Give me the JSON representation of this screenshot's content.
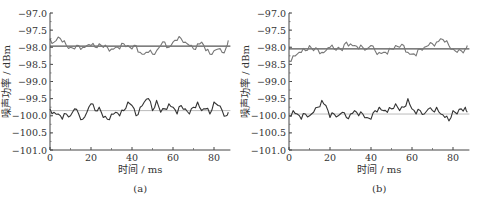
{
  "chart_data": [
    {
      "panel": "a",
      "type": "line",
      "caption": "(a)",
      "xlabel": "时间 / ms",
      "ylabel": "噪声功率 / dBm",
      "xlim": [
        0,
        88
      ],
      "ylim": [
        -101.0,
        -97.0
      ],
      "xticks": [
        0,
        20,
        40,
        60,
        80
      ],
      "xtick_labels": [
        "0",
        "20",
        "40",
        "60",
        "80"
      ],
      "yticks": [
        -97.0,
        -97.5,
        -98.0,
        -98.5,
        -99.0,
        -99.5,
        -100.0,
        -100.5,
        -101.0
      ],
      "ytick_labels": [
        "-97.0",
        "-97.5",
        "-98.0",
        "-98.5",
        "-99.0",
        "-99.5",
        "-100.0",
        "-100.5",
        "-101.0"
      ],
      "grid": false,
      "legend": null,
      "reference_lines": [
        {
          "name": "upper mean",
          "y": -97.97,
          "color": "#555555"
        },
        {
          "name": "lower mean",
          "y": -99.85,
          "color": "#bbbbbb"
        }
      ],
      "series": [
        {
          "name": "upper trace",
          "color": "#777777",
          "x": [
            0,
            2,
            4,
            6,
            8,
            10,
            12,
            14,
            16,
            18,
            20,
            22,
            24,
            26,
            28,
            30,
            32,
            34,
            36,
            38,
            40,
            42,
            44,
            46,
            48,
            50,
            52,
            54,
            56,
            58,
            60,
            62,
            64,
            66,
            68,
            70,
            72,
            74,
            76,
            78,
            80,
            82,
            84,
            86,
            87
          ],
          "values": [
            -97.75,
            -97.85,
            -97.7,
            -97.85,
            -97.95,
            -98.0,
            -98.05,
            -97.95,
            -98.0,
            -97.95,
            -97.95,
            -98.0,
            -97.9,
            -98.0,
            -98.0,
            -98.05,
            -98.0,
            -98.05,
            -97.9,
            -97.95,
            -98.05,
            -97.95,
            -98.15,
            -98.2,
            -98.15,
            -98.2,
            -98.1,
            -97.95,
            -97.85,
            -98.0,
            -97.85,
            -97.8,
            -97.75,
            -97.85,
            -97.95,
            -98.05,
            -97.9,
            -97.85,
            -98.1,
            -98.2,
            -98.1,
            -98.05,
            -98.15,
            -98.0,
            -97.8
          ]
        },
        {
          "name": "lower trace",
          "color": "#333333",
          "x": [
            0,
            2,
            4,
            6,
            8,
            10,
            12,
            14,
            16,
            18,
            20,
            22,
            24,
            26,
            28,
            30,
            32,
            34,
            36,
            38,
            40,
            42,
            44,
            46,
            48,
            50,
            52,
            54,
            56,
            58,
            60,
            62,
            64,
            66,
            68,
            70,
            72,
            74,
            76,
            78,
            80,
            82,
            84,
            86,
            87
          ],
          "values": [
            -99.8,
            -99.9,
            -99.95,
            -100.1,
            -99.95,
            -100.0,
            -99.8,
            -99.95,
            -100.1,
            -99.9,
            -99.65,
            -99.85,
            -99.75,
            -100.05,
            -100.1,
            -99.95,
            -99.9,
            -100.0,
            -99.85,
            -99.6,
            -99.7,
            -100.0,
            -99.75,
            -99.6,
            -99.5,
            -99.85,
            -99.55,
            -99.9,
            -99.8,
            -99.65,
            -99.75,
            -99.95,
            -99.7,
            -99.8,
            -99.95,
            -99.75,
            -99.6,
            -99.85,
            -99.8,
            -99.95,
            -99.6,
            -99.7,
            -99.85,
            -100.0,
            -99.9
          ]
        }
      ]
    },
    {
      "panel": "b",
      "type": "line",
      "caption": "(b)",
      "xlabel": "时间 / ms",
      "ylabel": "噪声功率 / dBm",
      "xlim": [
        0,
        88
      ],
      "ylim": [
        -101.0,
        -97.0
      ],
      "xticks": [
        0,
        20,
        40,
        60,
        80
      ],
      "xtick_labels": [
        "0",
        "20",
        "40",
        "60",
        "80"
      ],
      "yticks": [
        -97.0,
        -97.5,
        -98.0,
        -98.5,
        -99.0,
        -99.5,
        -100.0,
        -100.5,
        -101.0
      ],
      "ytick_labels": [
        "-97.0",
        "-97.5",
        "-98.0",
        "-98.5",
        "-99.0",
        "-99.5",
        "-100.0",
        "-100.5",
        "-101.0"
      ],
      "grid": false,
      "legend": null,
      "reference_lines": [
        {
          "name": "upper mean",
          "y": -98.05,
          "color": "#555555"
        },
        {
          "name": "lower mean",
          "y": -99.95,
          "color": "#bbbbbb"
        }
      ],
      "series": [
        {
          "name": "upper trace",
          "color": "#777777",
          "x": [
            0,
            2,
            4,
            6,
            8,
            10,
            12,
            14,
            16,
            18,
            20,
            22,
            24,
            26,
            28,
            30,
            32,
            34,
            36,
            38,
            40,
            42,
            44,
            46,
            48,
            50,
            52,
            54,
            56,
            58,
            60,
            62,
            64,
            66,
            68,
            70,
            72,
            74,
            76,
            78,
            80,
            82,
            84,
            86,
            87
          ],
          "values": [
            -98.4,
            -98.25,
            -98.2,
            -98.15,
            -98.1,
            -97.95,
            -98.1,
            -98.05,
            -98.15,
            -98.1,
            -98.0,
            -98.05,
            -98.0,
            -98.1,
            -97.85,
            -97.9,
            -97.95,
            -98.05,
            -98.0,
            -98.05,
            -97.95,
            -98.1,
            -98.15,
            -98.15,
            -98.2,
            -98.05,
            -97.95,
            -98.0,
            -97.95,
            -98.15,
            -98.2,
            -98.25,
            -98.05,
            -98.0,
            -97.95,
            -97.9,
            -97.85,
            -97.75,
            -97.85,
            -97.95,
            -98.05,
            -98.15,
            -98.1,
            -98.05,
            -97.95
          ]
        },
        {
          "name": "lower trace",
          "color": "#333333",
          "x": [
            0,
            2,
            4,
            6,
            8,
            10,
            12,
            14,
            16,
            18,
            20,
            22,
            24,
            26,
            28,
            30,
            32,
            34,
            36,
            38,
            40,
            42,
            44,
            46,
            48,
            50,
            52,
            54,
            56,
            58,
            60,
            62,
            64,
            66,
            68,
            70,
            72,
            74,
            76,
            78,
            80,
            82,
            84,
            86,
            87
          ],
          "values": [
            -100.0,
            -99.85,
            -99.95,
            -100.1,
            -99.95,
            -100.0,
            -99.9,
            -99.75,
            -99.55,
            -99.7,
            -100.05,
            -99.95,
            -100.0,
            -99.9,
            -100.05,
            -99.95,
            -99.85,
            -100.0,
            -99.95,
            -100.05,
            -100.1,
            -99.85,
            -99.75,
            -99.85,
            -99.9,
            -99.8,
            -99.65,
            -99.85,
            -99.75,
            -99.5,
            -99.8,
            -99.95,
            -99.85,
            -99.95,
            -99.8,
            -99.85,
            -99.75,
            -99.95,
            -100.05,
            -100.15,
            -99.85,
            -99.95,
            -99.8,
            -99.75,
            -99.9
          ]
        }
      ]
    }
  ]
}
